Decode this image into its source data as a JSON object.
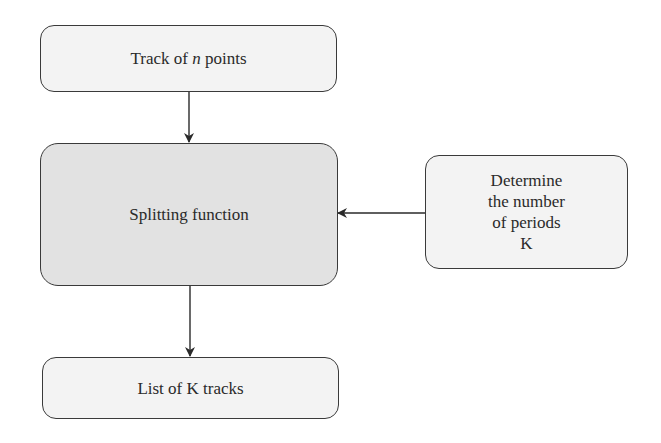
{
  "diagram": {
    "nodes": [
      {
        "id": "input",
        "label_pre": "Track of ",
        "label_var": "n",
        "label_post": " points"
      },
      {
        "id": "split",
        "label": "Splitting function"
      },
      {
        "id": "periods",
        "lines": [
          "Determine",
          "the number",
          "of periods",
          "K"
        ]
      },
      {
        "id": "output",
        "label": "List of K tracks"
      }
    ],
    "edges": [
      {
        "from": "input",
        "to": "split"
      },
      {
        "from": "periods",
        "to": "split"
      },
      {
        "from": "split",
        "to": "output"
      }
    ],
    "colors": {
      "stroke": "#3a3a3a",
      "box_fill": "#f3f3f3",
      "process_fill": "#e2e2e2"
    }
  }
}
